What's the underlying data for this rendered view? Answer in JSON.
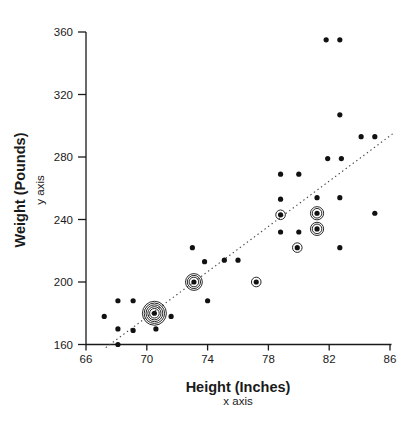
{
  "figure": {
    "background_color": "#ffffff",
    "ink_color": "#1a1a1a"
  },
  "chart_data": {
    "type": "scatter",
    "title": "",
    "xlabel": "Height (Inches)",
    "xlabel_sub": "x axis",
    "ylabel": "Weight (Pounds)",
    "ylabel_sub": "y axis",
    "xlim": [
      66,
      86
    ],
    "ylim": [
      160,
      360
    ],
    "x_ticks": [
      66,
      70,
      74,
      78,
      82,
      86
    ],
    "y_ticks": [
      160,
      200,
      240,
      280,
      320,
      360
    ],
    "grid": false,
    "legend": "none",
    "marker_color": "#111111",
    "marker_note": "rings = number of concentric circles around dot indicating repeated observations; 0 = plain dot",
    "trendline": {
      "style": "dotted",
      "color": "#444444",
      "x1": 67.3,
      "y1": 158,
      "x2": 86.2,
      "y2": 295
    },
    "points": [
      {
        "x": 67.2,
        "y": 178,
        "rings": 0
      },
      {
        "x": 68.1,
        "y": 188,
        "rings": 0
      },
      {
        "x": 69.1,
        "y": 188,
        "rings": 0
      },
      {
        "x": 68.1,
        "y": 170,
        "rings": 0
      },
      {
        "x": 69.1,
        "y": 169,
        "rings": 0
      },
      {
        "x": 70.6,
        "y": 170,
        "rings": 0
      },
      {
        "x": 68.1,
        "y": 160,
        "rings": 0
      },
      {
        "x": 71.6,
        "y": 178,
        "rings": 0
      },
      {
        "x": 70.5,
        "y": 180,
        "rings": 5
      },
      {
        "x": 73.0,
        "y": 222,
        "rings": 0
      },
      {
        "x": 73.8,
        "y": 213,
        "rings": 0
      },
      {
        "x": 73.1,
        "y": 200,
        "rings": 3
      },
      {
        "x": 74.0,
        "y": 188,
        "rings": 0
      },
      {
        "x": 75.1,
        "y": 214,
        "rings": 0
      },
      {
        "x": 76.0,
        "y": 214,
        "rings": 0
      },
      {
        "x": 77.2,
        "y": 200,
        "rings": 1
      },
      {
        "x": 78.8,
        "y": 253,
        "rings": 0
      },
      {
        "x": 81.2,
        "y": 254,
        "rings": 0
      },
      {
        "x": 82.7,
        "y": 254,
        "rings": 0
      },
      {
        "x": 78.8,
        "y": 243,
        "rings": 1
      },
      {
        "x": 81.2,
        "y": 244,
        "rings": 2
      },
      {
        "x": 78.8,
        "y": 232,
        "rings": 0
      },
      {
        "x": 80.0,
        "y": 232,
        "rings": 0
      },
      {
        "x": 81.2,
        "y": 234,
        "rings": 2
      },
      {
        "x": 79.9,
        "y": 222,
        "rings": 1
      },
      {
        "x": 82.7,
        "y": 222,
        "rings": 0
      },
      {
        "x": 81.9,
        "y": 279,
        "rings": 0
      },
      {
        "x": 82.8,
        "y": 279,
        "rings": 0
      },
      {
        "x": 78.8,
        "y": 269,
        "rings": 0
      },
      {
        "x": 80.0,
        "y": 269,
        "rings": 0
      },
      {
        "x": 82.7,
        "y": 307,
        "rings": 0
      },
      {
        "x": 84.1,
        "y": 293,
        "rings": 0
      },
      {
        "x": 85.0,
        "y": 293,
        "rings": 0
      },
      {
        "x": 81.8,
        "y": 355,
        "rings": 0
      },
      {
        "x": 82.7,
        "y": 355,
        "rings": 0
      },
      {
        "x": 85.0,
        "y": 244,
        "rings": 0
      }
    ]
  }
}
